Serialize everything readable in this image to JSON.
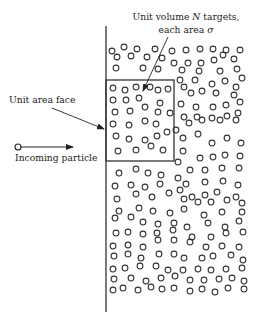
{
  "figure": {
    "labels": {
      "targets_line1_prefix": "Unit volume ",
      "targets_line1_symbol": "N",
      "targets_line1_suffix": " targets,",
      "targets_line2_prefix": "each area ",
      "targets_line2_symbol": "σ",
      "unit_area_face": "Unit area face",
      "incoming_particle": "Incoming particle"
    },
    "elements": {
      "target_medium": "slab of randomly distributed target particles",
      "unit_volume_box": "unit volume region",
      "incoming_particle": "particle moving toward slab"
    },
    "colors": {
      "ink": "#222222",
      "background": "#ffffff"
    }
  }
}
